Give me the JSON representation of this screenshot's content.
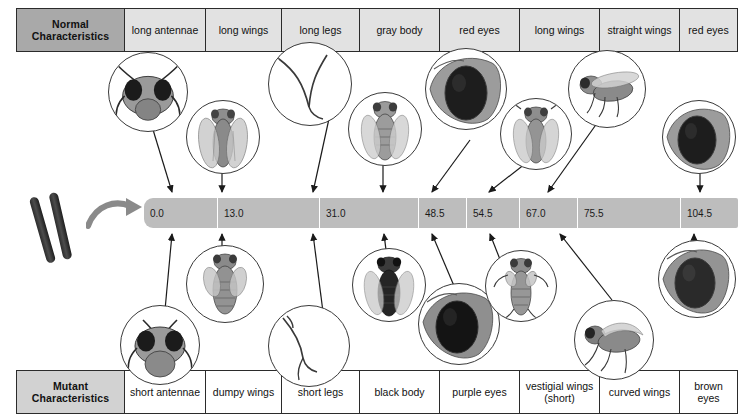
{
  "diagram": {
    "normal_row_label": "Normal\nCharacteristics",
    "mutant_row_label": "Mutant\nCharacteristics",
    "bar_color": "#bdbdbd",
    "normal_header_color": "#a9a9a9",
    "mutant_header_color": "#d2d2d2"
  },
  "normal_header": {
    "label_line1": "Normal",
    "label_line2": "Characteristics"
  },
  "mutant_header": {
    "label_line1": "Mutant",
    "label_line2": "Characteristics"
  },
  "normal_characteristics": [
    {
      "label": "long antennae"
    },
    {
      "label": "long wings"
    },
    {
      "label": "long legs"
    },
    {
      "label": "gray body"
    },
    {
      "label": "red eyes"
    },
    {
      "label": "long wings"
    },
    {
      "label": "straight wings"
    },
    {
      "label": "red eyes"
    }
  ],
  "mutant_characteristics": [
    {
      "label": "short antennae"
    },
    {
      "label": "dumpy wings"
    },
    {
      "label": "short legs"
    },
    {
      "label": "black body"
    },
    {
      "label": "purple eyes"
    },
    {
      "label": "vestigial wings\n(short)"
    },
    {
      "label": "curved wings"
    },
    {
      "label": "brown eyes"
    }
  ],
  "chart_data": {
    "type": "table",
    "xlabel": "Map position (map units)",
    "axis_range": [
      0.0,
      104.5
    ],
    "categories": [
      "0.0",
      "13.0",
      "31.0",
      "48.5",
      "54.5",
      "67.0",
      "75.5",
      "104.5"
    ],
    "values": [
      0.0,
      13.0,
      31.0,
      48.5,
      54.5,
      67.0,
      75.5,
      104.5
    ],
    "loci": [
      {
        "position": "0.0",
        "normal": "long antennae",
        "mutant": "short antennae"
      },
      {
        "position": "13.0",
        "normal": "long wings",
        "mutant": "dumpy wings"
      },
      {
        "position": "31.0",
        "normal": "long legs",
        "mutant": "short legs"
      },
      {
        "position": "48.5",
        "normal": "gray body",
        "mutant": "black body"
      },
      {
        "position": "54.5",
        "normal": "red eyes",
        "mutant": "purple eyes"
      },
      {
        "position": "67.0",
        "normal": "long wings",
        "mutant": "vestigial wings (short)"
      },
      {
        "position": "75.5",
        "normal": "straight wings",
        "mutant": "curved wings"
      },
      {
        "position": "104.5",
        "normal": "red eyes",
        "mutant": "brown eyes"
      }
    ]
  },
  "map_positions": [
    {
      "value": "0.0"
    },
    {
      "value": "13.0"
    },
    {
      "value": "31.0"
    },
    {
      "value": "48.5"
    },
    {
      "value": "54.5"
    },
    {
      "value": "67.0"
    },
    {
      "value": "75.5"
    },
    {
      "value": "104.5"
    }
  ],
  "bubbles_top": [
    {
      "art": "fly-head-normal-antennae"
    },
    {
      "art": "fly-long-wings-dorsal"
    },
    {
      "art": "fly-long-legs"
    },
    {
      "art": "fly-gray-body-dorsal"
    },
    {
      "art": "fly-red-eye-closeup"
    },
    {
      "art": "fly-long-wings-dorsal-2"
    },
    {
      "art": "fly-straight-wings-side"
    },
    {
      "art": "fly-red-eye-closeup-2"
    }
  ],
  "bubbles_bottom": [
    {
      "art": "fly-head-short-antennae"
    },
    {
      "art": "fly-dumpy-wings-dorsal"
    },
    {
      "art": "fly-short-legs"
    },
    {
      "art": "fly-black-body-dorsal"
    },
    {
      "art": "fly-purple-eye-closeup"
    },
    {
      "art": "fly-vestigial-wings-dorsal"
    },
    {
      "art": "fly-curved-wings-side"
    },
    {
      "art": "fly-brown-eye-closeup"
    }
  ]
}
